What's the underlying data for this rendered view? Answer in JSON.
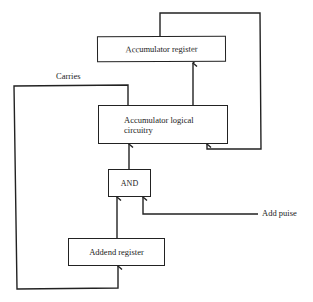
{
  "diagram": {
    "boxes": {
      "accumulator_register": "Accumulator register",
      "accumulator_logical_circuitry_line1": "Accumulator logical",
      "accumulator_logical_circuitry_line2": "circuitry",
      "and_gate": "AND",
      "addend_register": "Addend register"
    },
    "labels": {
      "carries": "Carries",
      "add_pulse": "Add puise"
    },
    "connections": [
      {
        "from": "Accumulator register",
        "to": "Accumulator logical circuitry",
        "label": "feedback loop"
      },
      {
        "from": "Accumulator logical circuitry",
        "to": "Accumulator register"
      },
      {
        "from": "Accumulator logical circuitry",
        "to": "Addend register",
        "label": "Carries"
      },
      {
        "from": "AND",
        "to": "Accumulator logical circuitry"
      },
      {
        "from": "Addend register",
        "to": "AND"
      },
      {
        "from": "Add puise",
        "to": "AND"
      }
    ],
    "colors": {
      "line": "#222222",
      "background": "#ffffff"
    }
  }
}
